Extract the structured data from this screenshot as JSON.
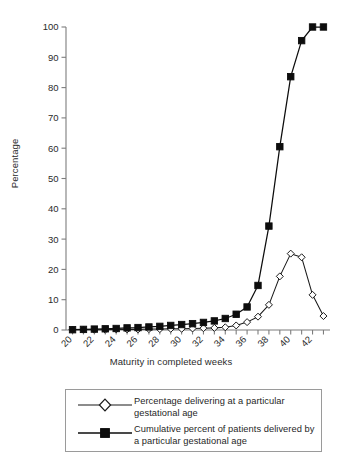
{
  "chart_data": {
    "type": "line",
    "title": "",
    "xlabel": "Maturity in completed weeks",
    "ylabel": "Percentage",
    "xlim": [
      19.4,
      43.6
    ],
    "ylim": [
      0,
      100
    ],
    "grid": false,
    "legend_position": "below",
    "x": [
      20,
      21,
      22,
      23,
      24,
      25,
      26,
      27,
      28,
      29,
      30,
      31,
      32,
      33,
      34,
      35,
      36,
      37,
      38,
      39,
      40,
      41,
      42,
      43
    ],
    "x_tick_labels": [
      "20",
      "22",
      "24",
      "26",
      "28",
      "30",
      "32",
      "34",
      "36",
      "38",
      "40",
      "42"
    ],
    "x_tick_values": [
      20,
      22,
      24,
      26,
      28,
      30,
      32,
      34,
      36,
      38,
      40,
      42
    ],
    "y_tick_labels": [
      "0",
      "10",
      "20",
      "30",
      "40",
      "50",
      "60",
      "70",
      "80",
      "90",
      "100"
    ],
    "y_tick_values": [
      0,
      10,
      20,
      30,
      40,
      50,
      60,
      70,
      80,
      90,
      100
    ],
    "series": [
      {
        "name": "Percentage delivering at a particular gestational age",
        "marker": "open-diamond",
        "color": "#1a1a1a",
        "fill": "#ffffff",
        "values": [
          0.1,
          0.1,
          0.1,
          0.1,
          0.2,
          0.2,
          0.2,
          0.3,
          0.3,
          0.4,
          0.4,
          0.5,
          0.6,
          0.7,
          0.9,
          1.5,
          2.6,
          4.4,
          8.3,
          17.7,
          25.2,
          24.0,
          11.6,
          4.6
        ]
      },
      {
        "name": "Cumulative percent of patients delivered by a particular gestational age",
        "marker": "filled-square",
        "color": "#0d0d0d",
        "fill": "#0d0d0d",
        "values": [
          0.1,
          0.2,
          0.3,
          0.4,
          0.5,
          0.7,
          0.8,
          1.0,
          1.2,
          1.5,
          1.8,
          2.1,
          2.5,
          3.0,
          3.8,
          5.2,
          7.6,
          14.7,
          34.3,
          60.5,
          83.6,
          95.5,
          100.0,
          100.0
        ]
      }
    ]
  },
  "legend": {
    "entries": [
      {
        "marker": "open-diamond",
        "label": "Percentage delivering at a particular gestational age"
      },
      {
        "marker": "filled-square",
        "label": "Cumulative percent of patients delivered by a particular gestational age"
      }
    ]
  }
}
